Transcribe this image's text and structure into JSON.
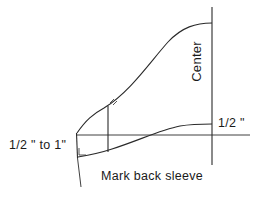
{
  "diagram": {
    "title": "Mark back sleeve",
    "background_color": "#ffffff",
    "line_color": "#2a2a2a",
    "text_color": "#1a1a1a",
    "labels": {
      "left_measure": "1/2 \" to 1\"",
      "right_measure": "1/2 \"",
      "center": "Center",
      "caption": "Mark back sleeve"
    },
    "annotations": {
      "right_angle_mark": "right-angle-symbol",
      "tick_mark": "tick-mark"
    }
  }
}
